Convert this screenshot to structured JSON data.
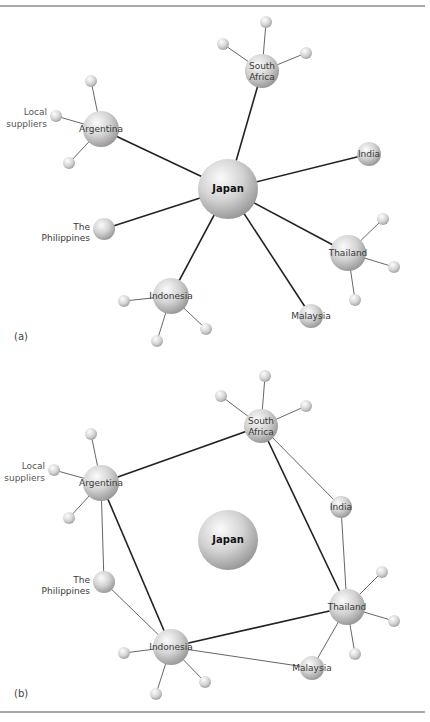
{
  "figure": {
    "panels": [
      {
        "id": "a",
        "label": "(a)",
        "label_pos": [
          14,
          340
        ],
        "nodes": [
          {
            "id": "japan",
            "label": "Japan",
            "x": 228,
            "y": 189,
            "r": 30,
            "bold": true
          },
          {
            "id": "south_africa",
            "label": "South Africa",
            "lines": [
              "South",
              "Africa"
            ],
            "x": 262,
            "y": 71,
            "r": 17
          },
          {
            "id": "argentina",
            "label": "Argentina",
            "x": 101,
            "y": 129,
            "r": 18
          },
          {
            "id": "india",
            "label": "India",
            "x": 369,
            "y": 154,
            "r": 12
          },
          {
            "id": "philippines",
            "label": "The Philippines",
            "lines": [
              "The",
              "Philippines"
            ],
            "x": 104,
            "y": 229,
            "r": 11,
            "label_side": "left"
          },
          {
            "id": "indonesia",
            "label": "Indonesia",
            "x": 171,
            "y": 296,
            "r": 18
          },
          {
            "id": "thailand",
            "label": "Thailand",
            "x": 348,
            "y": 253,
            "r": 18
          },
          {
            "id": "malaysia",
            "label": "Malaysia",
            "x": 311,
            "y": 316,
            "r": 12
          }
        ],
        "edges_major": [
          [
            "japan",
            "south_africa"
          ],
          [
            "japan",
            "argentina"
          ],
          [
            "japan",
            "india"
          ],
          [
            "japan",
            "philippines"
          ],
          [
            "japan",
            "indonesia"
          ],
          [
            "japan",
            "thailand"
          ],
          [
            "japan",
            "malaysia"
          ]
        ],
        "satellites": [
          {
            "parent": "south_africa",
            "x": 266,
            "y": 22,
            "r": 6
          },
          {
            "parent": "south_africa",
            "x": 223,
            "y": 44,
            "r": 6
          },
          {
            "parent": "south_africa",
            "x": 306,
            "y": 53,
            "r": 6
          },
          {
            "parent": "argentina",
            "x": 91,
            "y": 81,
            "r": 6
          },
          {
            "parent": "argentina",
            "x": 56,
            "y": 116,
            "r": 6,
            "label": "Local suppliers",
            "lines": [
              "Local",
              "suppliers"
            ]
          },
          {
            "parent": "argentina",
            "x": 69,
            "y": 163,
            "r": 6
          },
          {
            "parent": "indonesia",
            "x": 124,
            "y": 301,
            "r": 6
          },
          {
            "parent": "indonesia",
            "x": 157,
            "y": 341,
            "r": 6
          },
          {
            "parent": "indonesia",
            "x": 206,
            "y": 329,
            "r": 6
          },
          {
            "parent": "thailand",
            "x": 383,
            "y": 219,
            "r": 6
          },
          {
            "parent": "thailand",
            "x": 394,
            "y": 267,
            "r": 6
          },
          {
            "parent": "thailand",
            "x": 355,
            "y": 300,
            "r": 6
          }
        ],
        "edges_minor": []
      },
      {
        "id": "b",
        "label": "(b)",
        "label_pos": [
          14,
          697
        ],
        "nodes": [
          {
            "id": "japan",
            "label": "Japan",
            "x": 228,
            "y": 540,
            "r": 30,
            "bold": true
          },
          {
            "id": "south_africa",
            "label": "South Africa",
            "lines": [
              "South",
              "Africa"
            ],
            "x": 261,
            "y": 426,
            "r": 17
          },
          {
            "id": "argentina",
            "label": "Argentina",
            "x": 101,
            "y": 483,
            "r": 18
          },
          {
            "id": "india",
            "label": "India",
            "x": 341,
            "y": 507,
            "r": 11
          },
          {
            "id": "philippines",
            "label": "The Philippines",
            "lines": [
              "The",
              "Philippines"
            ],
            "x": 104,
            "y": 582,
            "r": 11,
            "label_side": "left"
          },
          {
            "id": "indonesia",
            "label": "Indonesia",
            "x": 171,
            "y": 647,
            "r": 18
          },
          {
            "id": "thailand",
            "label": "Thailand",
            "x": 347,
            "y": 607,
            "r": 18
          },
          {
            "id": "malaysia",
            "label": "Malaysia",
            "x": 312,
            "y": 668,
            "r": 12
          }
        ],
        "edges_major": [
          [
            "argentina",
            "south_africa"
          ],
          [
            "south_africa",
            "thailand"
          ],
          [
            "thailand",
            "indonesia"
          ],
          [
            "indonesia",
            "argentina"
          ]
        ],
        "edges_minor": [
          [
            "south_africa",
            "india"
          ],
          [
            "india",
            "thailand"
          ],
          [
            "argentina",
            "philippines"
          ],
          [
            "philippines",
            "indonesia"
          ],
          [
            "indonesia",
            "malaysia"
          ],
          [
            "malaysia",
            "thailand"
          ]
        ],
        "satellites": [
          {
            "parent": "south_africa",
            "x": 265,
            "y": 376,
            "r": 6
          },
          {
            "parent": "south_africa",
            "x": 221,
            "y": 396,
            "r": 6
          },
          {
            "parent": "south_africa",
            "x": 306,
            "y": 406,
            "r": 6
          },
          {
            "parent": "argentina",
            "x": 91,
            "y": 434,
            "r": 6
          },
          {
            "parent": "argentina",
            "x": 54,
            "y": 470,
            "r": 6,
            "label": "Local suppliers",
            "lines": [
              "Local",
              "suppliers"
            ]
          },
          {
            "parent": "argentina",
            "x": 69,
            "y": 518,
            "r": 6
          },
          {
            "parent": "indonesia",
            "x": 124,
            "y": 653,
            "r": 6
          },
          {
            "parent": "indonesia",
            "x": 156,
            "y": 694,
            "r": 6
          },
          {
            "parent": "indonesia",
            "x": 205,
            "y": 682,
            "r": 6
          },
          {
            "parent": "thailand",
            "x": 382,
            "y": 572,
            "r": 6
          },
          {
            "parent": "thailand",
            "x": 394,
            "y": 621,
            "r": 6
          },
          {
            "parent": "thailand",
            "x": 355,
            "y": 654,
            "r": 6
          }
        ]
      }
    ],
    "rules": {
      "top_y": 6,
      "bottom_y": 712,
      "x1": 0,
      "x2": 425
    },
    "colors": {
      "rule": "#555555",
      "edge_major": "#222222",
      "edge_minor": "#555555",
      "sphere_light": "#fafafa",
      "sphere_mid": "#c8c8c8",
      "sphere_dark": "#8e8e8e"
    }
  }
}
